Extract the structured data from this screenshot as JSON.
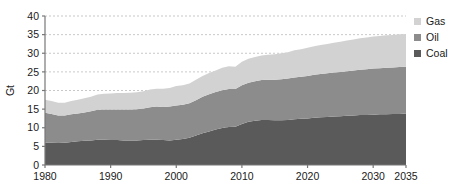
{
  "chart_data": {
    "type": "area",
    "stacked": true,
    "title": "",
    "xlabel": "",
    "ylabel": "Gt",
    "xlim": [
      1980,
      2035
    ],
    "ylim": [
      0,
      40
    ],
    "grid": true,
    "grid_style": "dashed-horizontal",
    "legend_position": "top-right",
    "x_ticks": [
      1980,
      1990,
      2000,
      2010,
      2020,
      2030,
      2035
    ],
    "x_tick_labels": [
      "1980",
      "1990",
      "2000",
      "2010",
      "2020",
      "2030",
      "2035"
    ],
    "y_ticks": [
      0,
      5,
      10,
      15,
      20,
      25,
      30,
      35,
      40
    ],
    "y_tick_labels": [
      "0",
      "5",
      "10",
      "15",
      "20",
      "25",
      "30",
      "35",
      "40"
    ],
    "x": [
      1980,
      1981,
      1982,
      1983,
      1984,
      1985,
      1986,
      1987,
      1988,
      1989,
      1990,
      1991,
      1992,
      1993,
      1994,
      1995,
      1996,
      1997,
      1998,
      1999,
      2000,
      2001,
      2002,
      2003,
      2004,
      2005,
      2006,
      2007,
      2008,
      2009,
      2010,
      2011,
      2012,
      2013,
      2014,
      2015,
      2016,
      2017,
      2018,
      2019,
      2020,
      2021,
      2022,
      2023,
      2024,
      2025,
      2026,
      2027,
      2028,
      2029,
      2030,
      2031,
      2032,
      2033,
      2034,
      2035
    ],
    "series": [
      {
        "name": "Coal",
        "color": "#5a5a5a",
        "values": [
          6.0,
          6.0,
          5.9,
          6.0,
          6.2,
          6.4,
          6.5,
          6.6,
          6.8,
          6.8,
          6.7,
          6.7,
          6.6,
          6.6,
          6.6,
          6.7,
          6.8,
          6.8,
          6.7,
          6.6,
          6.8,
          7.0,
          7.3,
          7.9,
          8.5,
          9.0,
          9.5,
          9.9,
          10.2,
          10.3,
          11.0,
          11.6,
          11.9,
          12.1,
          12.1,
          12.0,
          12.0,
          12.1,
          12.3,
          12.4,
          12.5,
          12.7,
          12.8,
          12.9,
          13.0,
          13.1,
          13.2,
          13.3,
          13.4,
          13.4,
          13.5,
          13.6,
          13.6,
          13.7,
          13.7,
          13.8
        ]
      },
      {
        "name": "Oil",
        "color": "#8c8c8c",
        "values": [
          8.0,
          7.7,
          7.4,
          7.3,
          7.4,
          7.4,
          7.6,
          7.8,
          8.0,
          8.1,
          8.2,
          8.2,
          8.3,
          8.3,
          8.4,
          8.5,
          8.7,
          8.9,
          8.9,
          9.1,
          9.2,
          9.2,
          9.3,
          9.5,
          9.8,
          10.0,
          10.1,
          10.2,
          10.2,
          10.1,
          10.4,
          10.5,
          10.6,
          10.7,
          10.8,
          10.9,
          11.0,
          11.1,
          11.2,
          11.3,
          11.4,
          11.5,
          11.6,
          11.7,
          11.8,
          11.9,
          12.0,
          12.1,
          12.2,
          12.3,
          12.4,
          12.4,
          12.5,
          12.5,
          12.6,
          12.6
        ]
      },
      {
        "name": "Gas",
        "color": "#d2d2d2",
        "values": [
          3.5,
          3.5,
          3.4,
          3.4,
          3.6,
          3.7,
          3.8,
          3.9,
          4.1,
          4.2,
          4.3,
          4.4,
          4.4,
          4.5,
          4.5,
          4.6,
          4.8,
          4.8,
          4.9,
          5.0,
          5.2,
          5.2,
          5.3,
          5.5,
          5.6,
          5.7,
          5.8,
          6.0,
          6.1,
          6.0,
          6.3,
          6.4,
          6.5,
          6.6,
          6.7,
          6.8,
          7.0,
          7.1,
          7.3,
          7.4,
          7.6,
          7.7,
          7.8,
          7.9,
          8.0,
          8.1,
          8.2,
          8.3,
          8.4,
          8.5,
          8.6,
          8.6,
          8.7,
          8.7,
          8.8,
          8.8
        ]
      }
    ],
    "legend": [
      {
        "label": "Gas",
        "color": "#d2d2d2"
      },
      {
        "label": "Oil",
        "color": "#8c8c8c"
      },
      {
        "label": "Coal",
        "color": "#5a5a5a"
      }
    ],
    "axis_color": "#777777",
    "grid_color": "#bbbbbb"
  }
}
